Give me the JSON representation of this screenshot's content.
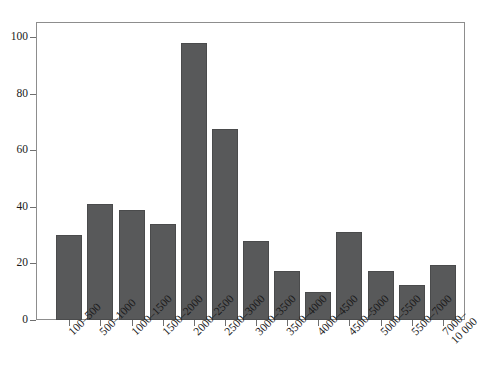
{
  "chart_data": {
    "type": "bar",
    "title": "",
    "subtitle": "",
    "xlabel": "",
    "ylabel": "",
    "ylim": [
      0,
      105
    ],
    "grid": false,
    "legend": "none",
    "bar_color": "#58595a",
    "background_color": "#ffffff",
    "axis_color": "#8d8d8d",
    "y_ticks": [
      0,
      20,
      40,
      60,
      80,
      100
    ],
    "categories": [
      "100–500",
      "500–1000",
      "1000–1500",
      "1500–2000",
      "2000–2500",
      "2500–3000",
      "3000–3500",
      "3500–4000",
      "4000–4500",
      "4500–5000",
      "5000–5500",
      "5500–7000",
      "7000–\n10 000"
    ],
    "values": [
      30,
      41,
      39,
      34,
      98,
      67.5,
      28,
      17.5,
      10,
      31,
      17.5,
      12.5,
      19.5
    ]
  }
}
